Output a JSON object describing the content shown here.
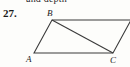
{
  "page": {
    "clipped_header_text": "and depth",
    "background_color": "#fdfdfb",
    "ink_color": "#2b2b2b"
  },
  "problem": {
    "number": "27."
  },
  "figure": {
    "type": "parallelogram-with-diagonal",
    "stroke_color": "#3a3a3a",
    "vertices": [
      {
        "label": "A",
        "x": 34,
        "y": 53
      },
      {
        "label": "B",
        "x": 52,
        "y": 20
      },
      {
        "label": "C",
        "x": 113,
        "y": 53
      },
      {
        "label": "",
        "x": 131,
        "y": 20
      }
    ],
    "edges": [
      {
        "from": "A",
        "to": "B"
      },
      {
        "from": "B",
        "to": "D"
      },
      {
        "from": "D",
        "to": "C"
      },
      {
        "from": "C",
        "to": "A"
      }
    ],
    "diagonal": {
      "from": "B",
      "to": "C"
    },
    "labels": {
      "a": "A",
      "b": "B",
      "c": "C"
    }
  }
}
